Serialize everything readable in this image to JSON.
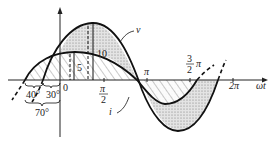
{
  "diagram": {
    "type": "phase-shift-waveforms",
    "axis": {
      "horizontal_label": "ωt",
      "origin_label": "0",
      "ticks": [
        {
          "id": "pi_over_2",
          "num": "π",
          "den": "2"
        },
        {
          "id": "pi",
          "label": "π"
        },
        {
          "id": "three_pi_over_2",
          "num": "3",
          "den": "2",
          "suffix": "π"
        },
        {
          "id": "two_pi",
          "label": "2π"
        }
      ]
    },
    "curves": [
      {
        "name": "v",
        "label": "v",
        "amplitude": 10,
        "phase_deg": 30,
        "fill": "stippled"
      },
      {
        "name": "i",
        "label": "i",
        "amplitude": 5,
        "phase_deg": 70,
        "fill": "hatched"
      }
    ],
    "amplitude_labels": {
      "v": "10",
      "i": "5"
    },
    "angle_labels": {
      "a": "40°",
      "b": "30°",
      "total": "70°"
    }
  }
}
